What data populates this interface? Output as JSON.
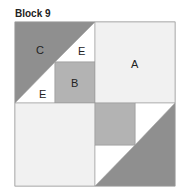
{
  "title": "Block 9",
  "labels": {
    "a": "A",
    "b": "B",
    "c": "C",
    "e1": "E",
    "e2": "E"
  },
  "colors": {
    "light": "#f1f1f1",
    "medium": "#b3b3b3",
    "dark": "#8f8f8f",
    "white": "#ffffff",
    "stroke": "#9a9a9a"
  }
}
